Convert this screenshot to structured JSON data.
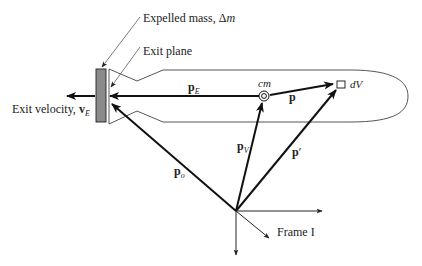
{
  "labels": {
    "expelled_mass": "Expelled mass, Δ",
    "expelled_mass_sym": "m",
    "exit_plane": "Exit plane",
    "exit_velocity": "Exit velocity, ",
    "exit_velocity_vec": "v",
    "exit_velocity_sub": "E",
    "cm": "cm",
    "dV": "dV",
    "frame": "Frame I"
  },
  "vectors": {
    "pE": {
      "base": "p",
      "sub": "E"
    },
    "p": {
      "base": "p"
    },
    "pV": {
      "base": "p",
      "sub": "V"
    },
    "pprime": {
      "base": "p",
      "sup": "′"
    },
    "po": {
      "base": "p",
      "sub": "o"
    }
  },
  "colors": {
    "line": "#111111",
    "expelled_mass_fill": "#8a8a8a",
    "thin_line": "#444444"
  }
}
